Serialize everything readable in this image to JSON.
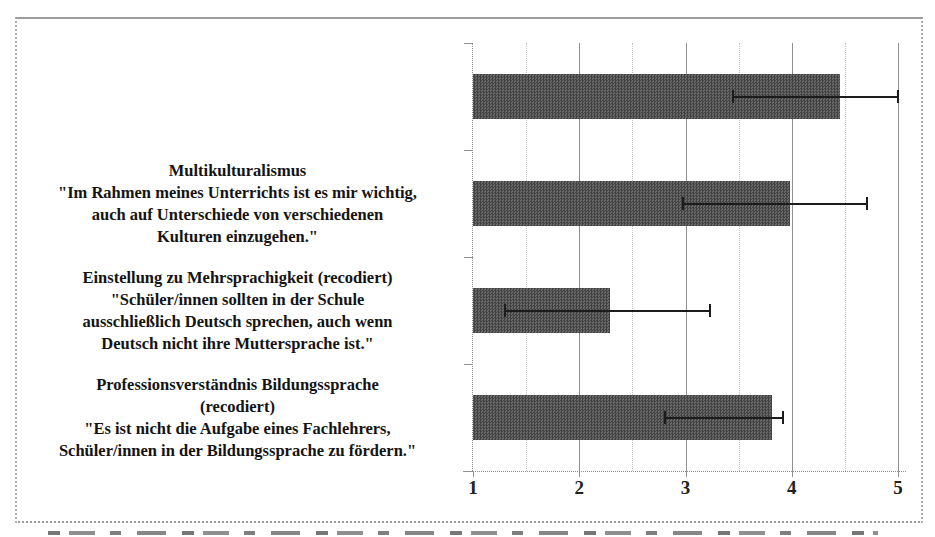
{
  "chart_data": {
    "type": "bar",
    "orientation": "horizontal",
    "title": "",
    "xlabel": "",
    "ylabel": "",
    "xlim": [
      1,
      5
    ],
    "x_ticks": [
      "1",
      "2",
      "3",
      "4",
      "5"
    ],
    "grid": {
      "major_step": 1,
      "minor_step": 0.5,
      "legend_position": "none"
    },
    "bar_color": "#565656",
    "categories": [
      "",
      "Multikulturalismus\n\"Im Rahmen meines Unterrichts ist es mir wichtig,\nauch auf Unterschiede von verschiedenen\nKulturen einzugehen.\"",
      "Einstellung zu Mehrsprachigkeit (recodiert)\n\"Schüler/innen sollten in der Schule\nausschließlich Deutsch sprechen, auch wenn\nDeutsch nicht ihre Muttersprache ist.\"",
      "Professionsverständnis Bildungssprache\n(recodiert)\n\"Es ist nicht die Aufgabe eines Fachlehrers,\nSchüler/innen in der Bildungssprache zu fördern.\""
    ],
    "values": [
      4.45,
      3.98,
      2.29,
      3.81
    ],
    "error_bars": [
      {
        "low": 3.45,
        "high": 5.0
      },
      {
        "low": 2.98,
        "high": 4.71
      },
      {
        "low": 1.3,
        "high": 3.23
      },
      {
        "low": 2.81,
        "high": 3.92
      }
    ]
  }
}
